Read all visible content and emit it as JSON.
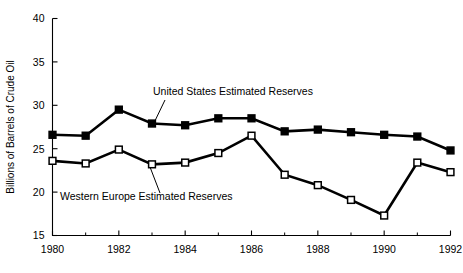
{
  "chart_data": {
    "type": "line",
    "title": "",
    "xlabel": "",
    "ylabel": "Billions of Barrels of Crude Oil",
    "x": [
      1980,
      1981,
      1982,
      1983,
      1984,
      1985,
      1986,
      1987,
      1988,
      1989,
      1990,
      1991,
      1992
    ],
    "xlim": [
      1980,
      1992
    ],
    "ylim": [
      15,
      40
    ],
    "xticks": [
      1980,
      1982,
      1984,
      1986,
      1988,
      1990,
      1992
    ],
    "xticklabels": [
      "1980",
      "1982",
      "1984",
      "1986",
      "1988",
      "1990",
      "1992"
    ],
    "xminorticks": [
      1981,
      1983,
      1985,
      1987,
      1989,
      1991
    ],
    "yticks": [
      15,
      20,
      25,
      30,
      35,
      40
    ],
    "yticklabels": [
      "15",
      "20",
      "25",
      "30",
      "35",
      "40"
    ],
    "grid": false,
    "legend_position": "inline-annotations",
    "series": [
      {
        "name": "United States Estimated Reserves",
        "marker": "filled-square",
        "color": "#000000",
        "values": [
          26.6,
          26.5,
          29.5,
          27.9,
          27.7,
          28.5,
          28.5,
          27.0,
          27.2,
          26.9,
          26.6,
          26.4,
          24.8
        ]
      },
      {
        "name": "Western Europe Estimated Reserves",
        "marker": "open-square",
        "color": "#000000",
        "values": [
          23.6,
          23.3,
          24.9,
          23.2,
          23.4,
          24.5,
          26.5,
          22.0,
          20.8,
          19.1,
          17.3,
          23.4,
          22.3
        ]
      }
    ],
    "annotations": [
      {
        "id": "us-annotation",
        "text": "United States Estimated Reserves",
        "text_x": 153,
        "text_y": 95,
        "leader_from_x": 165,
        "leader_from_y": 100,
        "leader_to_x": 152,
        "leader_to_y": 127
      },
      {
        "id": "we-annotation",
        "text": "Western Europe Estimated Reserves",
        "text_x": 60,
        "text_y": 200,
        "leader_from_x": 160,
        "leader_from_y": 193,
        "leader_to_x": 150,
        "leader_to_y": 167
      }
    ]
  }
}
